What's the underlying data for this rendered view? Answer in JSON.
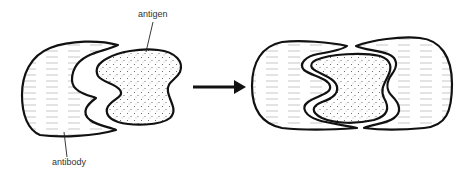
{
  "diagram": {
    "title": "",
    "labels": {
      "antigen": "antigen",
      "antibody": "antibody"
    },
    "panels": [
      {
        "name": "separate",
        "description": "antibody and antigen apart"
      },
      {
        "name": "bound",
        "description": "antigen enclosed by antibody (lock and key)"
      }
    ],
    "arrow": {
      "direction": "right"
    },
    "colors": {
      "stroke": "#111111",
      "background": "#ffffff",
      "stipple": "#555555",
      "hatch": "#9a9a9a"
    }
  }
}
